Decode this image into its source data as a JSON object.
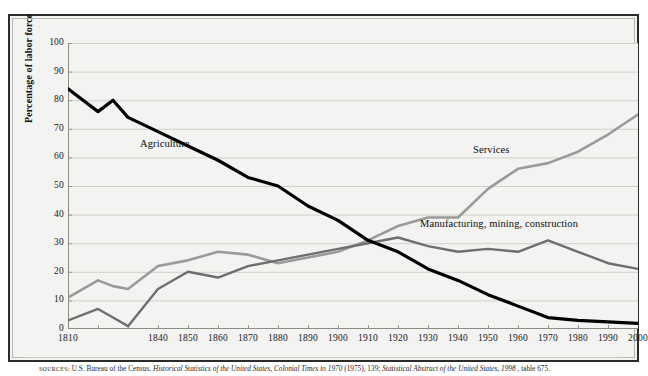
{
  "figure": {
    "y_axis_title": "Percentage of labor force",
    "source_label": "SOURCES:",
    "source_text_1": "U.S. Bureau of the Census, ",
    "source_italic_1": "Historical Statistics of the United States, Colonial Times to 1970",
    "source_text_2": " (1975), 139; ",
    "source_italic_2": "Statistical Abstract of the United States, 1998",
    "source_text_3": ", table 675."
  },
  "annotations": {
    "agriculture": "Agriculture",
    "services": "Services",
    "manufacturing": "Manufacturing, mining, construction"
  },
  "colors": {
    "agriculture": "#000000",
    "services": "#9a9a9a",
    "manufacturing": "#6e6e6e",
    "grid": "#c6c6c1",
    "axis": "#8d8d88",
    "frame": "#2b2b2b",
    "plot_background": "#f3f3f1"
  },
  "chart_data": {
    "type": "line",
    "title": "",
    "subtitle": "",
    "xlabel": "",
    "ylabel": "Percentage of labor force",
    "xlim": [
      1810,
      2000
    ],
    "ylim": [
      0,
      100
    ],
    "grid": true,
    "legend_position": "inline-annotations",
    "ytick_labels": [
      "0",
      "10",
      "20",
      "30",
      "40",
      "50",
      "60",
      "70",
      "80",
      "90",
      "100"
    ],
    "yticks": [
      0,
      10,
      20,
      30,
      40,
      50,
      60,
      70,
      80,
      90,
      100
    ],
    "xtick_labels": [
      "1810",
      "1840",
      "1850",
      "1860",
      "1870",
      "1880",
      "1890",
      "1900",
      "1910",
      "1920",
      "1930",
      "1940",
      "1950",
      "1960",
      "1970",
      "1980",
      "1990",
      "2000"
    ],
    "xticks": [
      1810,
      1840,
      1850,
      1860,
      1870,
      1880,
      1890,
      1900,
      1910,
      1920,
      1930,
      1940,
      1950,
      1960,
      1970,
      1980,
      1990,
      2000
    ],
    "x": [
      1810,
      1820,
      1825,
      1830,
      1840,
      1850,
      1860,
      1870,
      1880,
      1890,
      1900,
      1910,
      1920,
      1930,
      1940,
      1950,
      1960,
      1970,
      1980,
      1990,
      2000
    ],
    "series": [
      {
        "name": "Agriculture",
        "color": "#000000",
        "values": [
          84,
          76,
          80,
          74,
          69,
          64,
          59,
          53,
          50,
          43,
          38,
          31,
          27,
          21,
          17,
          12,
          8,
          4,
          3,
          2.5,
          2
        ]
      },
      {
        "name": "Services",
        "color": "#9a9a9a",
        "values": [
          11,
          17,
          15,
          14,
          22,
          24,
          27,
          26,
          23,
          25,
          27,
          31,
          36,
          39,
          39,
          49,
          56,
          58,
          62,
          68,
          75
        ]
      },
      {
        "name": "Manufacturing, mining, construction",
        "color": "#6e6e6e",
        "values": [
          3,
          7,
          4,
          1,
          14,
          20,
          18,
          22,
          24,
          26,
          28,
          30,
          32,
          29,
          27,
          28,
          27,
          31,
          27,
          23,
          21
        ]
      }
    ]
  }
}
